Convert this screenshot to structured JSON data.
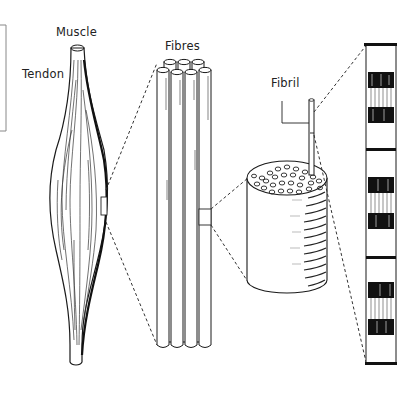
{
  "diagram": {
    "labels": {
      "muscle": "Muscle",
      "tendon": "Tendon",
      "fibres": "Fibres",
      "fibril": "Fibril"
    },
    "levels": [
      "Muscle",
      "Fibres",
      "Fibril bundle",
      "Fibril (sarcomere banding)"
    ],
    "colors": {
      "ink": "#1a1a1a",
      "background": "#ffffff",
      "frame": "#888888"
    }
  }
}
